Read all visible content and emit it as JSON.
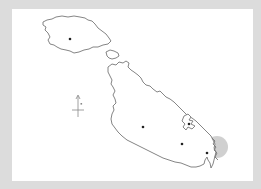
{
  "map": {
    "title": "Malta archipelago outline map",
    "background_color": "#dcdcdc",
    "card_color": "#ffffff",
    "coastline_color": "#777777",
    "marker_color": "#222222",
    "highlight_color": "#c8c8c8",
    "islands": [
      {
        "name": "Gozo",
        "marker": "settlement-dot"
      },
      {
        "name": "Comino",
        "marker": null
      },
      {
        "name": "Malta",
        "marker": "settlement-dots"
      }
    ],
    "markers": [
      {
        "id": "gozo-dot",
        "x": 70,
        "y": 39
      },
      {
        "id": "malta-center-dot",
        "x": 143,
        "y": 127
      },
      {
        "id": "malta-east-dot",
        "x": 182,
        "y": 144
      },
      {
        "id": "harbour-dot",
        "x": 189,
        "y": 124
      },
      {
        "id": "southeast-dot",
        "x": 207,
        "y": 153
      }
    ],
    "highlight_circle": {
      "cx": 217,
      "cy": 147,
      "r": 11
    },
    "compass": {
      "label": "north-arrow",
      "x": 79,
      "y": 108
    }
  }
}
